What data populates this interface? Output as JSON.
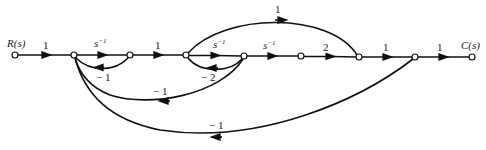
{
  "diagram": {
    "type": "signal-flow-graph",
    "nodes": [
      {
        "id": "R",
        "label": "R(s)",
        "x": 15,
        "y": 55
      },
      {
        "id": "n2",
        "x": 74,
        "y": 55
      },
      {
        "id": "n3",
        "x": 130,
        "y": 55
      },
      {
        "id": "n4",
        "x": 186,
        "y": 55
      },
      {
        "id": "n5",
        "x": 244,
        "y": 56
      },
      {
        "id": "n6",
        "x": 301,
        "y": 56
      },
      {
        "id": "n7",
        "x": 359,
        "y": 57
      },
      {
        "id": "n8",
        "x": 415,
        "y": 57
      },
      {
        "id": "C",
        "label": "C(s)",
        "x": 472,
        "y": 57
      }
    ],
    "branches": [
      {
        "from": "R",
        "to": "n2",
        "gain": "1"
      },
      {
        "from": "n2",
        "to": "n3",
        "gain": "s^-1"
      },
      {
        "from": "n3",
        "to": "n4",
        "gain": "1"
      },
      {
        "from": "n4",
        "to": "n5",
        "gain": "s^-1"
      },
      {
        "from": "n5",
        "to": "n6",
        "gain": "s^-1"
      },
      {
        "from": "n6",
        "to": "n7",
        "gain": "2"
      },
      {
        "from": "n7",
        "to": "n8",
        "gain": "1"
      },
      {
        "from": "n8",
        "to": "C",
        "gain": "1"
      },
      {
        "from": "n4",
        "to": "n7",
        "gain": "1"
      },
      {
        "from": "n3",
        "to": "n2",
        "gain": "-1"
      },
      {
        "from": "n5",
        "to": "n4",
        "gain": "-2"
      },
      {
        "from": "n5",
        "to": "n2",
        "gain": "-1"
      },
      {
        "from": "n8",
        "to": "n2",
        "gain": "-1"
      }
    ]
  },
  "labels": {
    "input": "R(s)",
    "output": "C(s)",
    "g_r_n2": "1",
    "g_n2_n3_base": "s",
    "g_n2_n3_exp": "−1",
    "g_n3_n4": "1",
    "g_n4_n5_base": "s",
    "g_n4_n5_exp": "−1",
    "g_n5_n6_base": "s",
    "g_n5_n6_exp": "−1",
    "g_n6_n7": "2",
    "g_n7_n8": "1",
    "g_n8_c": "1",
    "g_n4_n7": "1",
    "g_fb_n3_n2": "− 1",
    "g_fb_n5_n4": "− 2",
    "g_fb_n5_n2": "− 1",
    "g_fb_n8_n2": "− 1"
  }
}
